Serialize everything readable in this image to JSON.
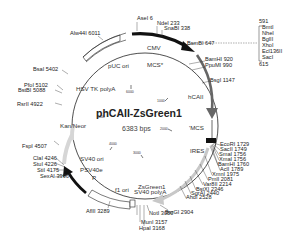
{
  "plasmid": {
    "name": "phCAII-ZsGreen1",
    "size_label": "6383 bps",
    "length": 6383
  },
  "features": {
    "puc_ori": "pUC ori",
    "cmv": "CMV",
    "mcs_top": "MCS*",
    "hcaii": "hCAII",
    "mcs_right": "'MCS",
    "ires": "IRES",
    "zsgreen1": "ZsGreen1",
    "sv40_polya": "SV40 polyA",
    "f1_ori": "f1 ori",
    "p": "P",
    "psv40e": "PSV40e",
    "sv40_ori": "SV40 ori",
    "kan_neo": "Kan/Neor",
    "hsv_tk_polya": "HSV TK polyA"
  },
  "ticks": [
    "1000",
    "2000",
    "3000",
    "4000",
    "5000",
    "6000"
  ],
  "sites": {
    "asei": "AseI 6",
    "ndei": "NdeI 233",
    "snabi": "SnaBI 338",
    "bsmbi": "BsmBI 647",
    "bamhi_920": "BamHI 920",
    "ppumi": "PpuMI 990",
    "bsgi": "BsgI 1147",
    "ecori": "EcoRI 1729",
    "sacii": "SacII 1749",
    "smai": "SmaI 1756",
    "xmai": "XmaI 1756",
    "bamhi_1760": "BamHI 1760",
    "acli": "AclI 1789",
    "xmni": "XmnI 1975",
    "pmli": "PmlI 2081",
    "var8ii": "Var8II 2214",
    "bstxi": "BstXI 2346",
    "sgrai": "SgrAI 2440",
    "ahdi": "AhdI 2528",
    "bsrgi": "BsrGI 2904",
    "noti": "NotI 3050",
    "muni": "MunI 3157",
    "hpai": "HpaI 3168",
    "aflii": "AflII 3289",
    "sexai": "SexAI 3996",
    "stii": "StiI 4175",
    "stui": "StuI 4226",
    "clai": "ClaI 4246",
    "fspi": "FspI 4507",
    "rsrii": "RsrII 4922",
    "bstbi": "BstBI 5088",
    "pfoi": "PfoI 5102",
    "bsai": "BsaI 5402",
    "alw44i": "Alw44I 6011"
  },
  "mcs_box": {
    "start": "591",
    "enzymes": [
      "BmtI",
      "NheI",
      "BglII",
      "XhoI",
      "Ecl136II",
      "SacI"
    ],
    "end": "615"
  }
}
